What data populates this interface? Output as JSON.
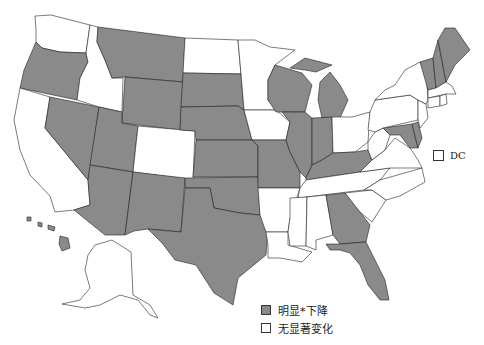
{
  "map": {
    "title": "",
    "colors": {
      "decline": "#8a8a8a",
      "no_change": "#ffffff",
      "border": "#222222"
    },
    "legend": [
      {
        "key": "decline",
        "label": "明显*下降",
        "color": "#8a8a8a"
      },
      {
        "key": "no_change",
        "label": "无显著变化",
        "color": "#ffffff"
      }
    ],
    "dc": {
      "label": "DC",
      "category": "no_change"
    },
    "states": {
      "WA": "no_change",
      "OR": "decline",
      "CA": "no_change",
      "NV": "decline",
      "ID": "no_change",
      "MT": "decline",
      "WY": "decline",
      "UT": "decline",
      "AZ": "decline",
      "CO": "no_change",
      "NM": "decline",
      "ND": "no_change",
      "SD": "decline",
      "NE": "decline",
      "KS": "decline",
      "OK": "decline",
      "TX": "decline",
      "MN": "no_change",
      "IA": "no_change",
      "MO": "decline",
      "AR": "no_change",
      "LA": "no_change",
      "WI": "decline",
      "IL": "decline",
      "MI": "decline",
      "IN": "decline",
      "OH": "no_change",
      "KY": "decline",
      "TN": "no_change",
      "MS": "no_change",
      "AL": "no_change",
      "GA": "decline",
      "FL": "decline",
      "SC": "no_change",
      "NC": "no_change",
      "VA": "no_change",
      "WV": "no_change",
      "MD": "decline",
      "DE": "decline",
      "PA": "no_change",
      "NJ": "no_change",
      "NY": "no_change",
      "CT": "no_change",
      "RI": "no_change",
      "MA": "no_change",
      "VT": "decline",
      "NH": "decline",
      "ME": "decline",
      "AK": "no_change",
      "HI": "decline"
    }
  }
}
